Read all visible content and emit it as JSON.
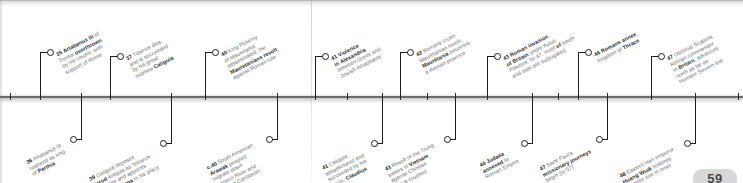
{
  "figure": {
    "kind": "historical-timeline",
    "orientation": "horizontal",
    "page_number": "59",
    "era_range": "35-48 AD"
  },
  "events_above": [
    {
      "id": "ev-35",
      "year": "35",
      "x": 40,
      "lines": [
        {
          "t": "35 ",
          "b": true
        },
        {
          "t": "Artabanus III",
          "b": true
        },
        {
          "t": " of",
          "b": false
        }
      ],
      "text_lines": [
        "35 Artabanus III of",
        "Persia overthrown",
        "by his cousin, with",
        "support of Rome"
      ],
      "bold_head": "35 Artabanus III",
      "bold_tail": "overthrown"
    },
    {
      "id": "ev-37",
      "year": "37",
      "x": 110,
      "text_lines": [
        "37 Tiberius dies",
        "and is succeeded",
        "by his great",
        "nephew Caligula"
      ],
      "bold_head": "37",
      "bold_tail": "Caligula"
    },
    {
      "id": "ev-40-ptolemy",
      "year": "40",
      "x": 205,
      "text_lines": [
        "40 King Ptolemy",
        "of Mauretania",
        "assassinated, the",
        "Mauretanians revolt",
        "against Roman rule"
      ],
      "bold_head": "40",
      "bold_tail": "Mauretanians revolt"
    },
    {
      "id": "ev-41-alexandria",
      "year": "41",
      "x": 315,
      "text_lines": [
        "41 Violence",
        "in Alexandria",
        "between Greek and",
        "Jewish inhabitants"
      ],
      "bold_head": "41 Violence in Alexandria",
      "bold_tail": ""
    },
    {
      "id": "ev-42",
      "year": "42",
      "x": 400,
      "text_lines": [
        "42 Romans crush",
        "Mauretanian revolt,",
        "Mauretania becomes",
        "a Roman province"
      ],
      "bold_head": "42",
      "bold_tail": "Mauretania"
    },
    {
      "id": "ev-43-britain",
      "year": "43",
      "x": 487,
      "text_lines": [
        "43 Roman invasion",
        "of Britain under Aulus",
        "Plautius; by 47, most of south",
        "and east are subjugated"
      ],
      "bold_head": "43 Roman invasion of Britain",
      "bold_tail": ""
    },
    {
      "id": "ev-46",
      "year": "46",
      "x": 578,
      "text_lines": [
        "46 Romans annex",
        "kingdom of Thrace"
      ],
      "bold_head": "46 Romans annex",
      "bold_tail": "Thrace"
    },
    {
      "id": "ev-47-ostorius",
      "year": "47",
      "x": 651,
      "text_lines": [
        "47 Ostorius Scapula,",
        "Roman commander",
        "in Britain, advances",
        "north as far as",
        "Humber-Severn line"
      ],
      "bold_head": "47",
      "bold_tail": "Britain"
    }
  ],
  "events_below": [
    {
      "id": "ev-36",
      "year": "36",
      "x": 81,
      "text_lines": [
        "36 Artabanus III",
        "restored as king",
        "of Parthia"
      ],
      "bold_head": "36",
      "bold_tail": "Parthia"
    },
    {
      "id": "ev-39",
      "year": "39",
      "x": 171,
      "text_lines": [
        "39 Caligula deposes",
        "Herod Antipas as Tetrarch",
        "of Galilee and appoints",
        "Herod Agrippa in his place"
      ],
      "bold_head": "39",
      "bold_tail": "Herod Agrippa"
    },
    {
      "id": "ev-c40-arawak",
      "year": "c.40",
      "x": 277,
      "text_lines": [
        "c.40 South American",
        "Arawak peoples",
        "migrate down",
        "Orinoco River and",
        "settle in Caribbean"
      ],
      "bold_head": "c.40",
      "bold_tail": "Arawak"
    },
    {
      "id": "ev-41-caligula",
      "year": "41",
      "x": 382,
      "text_lines": [
        "41 Caligula",
        "assassinated and",
        "succeeded by his",
        "uncle, Claudius"
      ],
      "bold_head": "41",
      "bold_tail": "Claudius"
    },
    {
      "id": "ev-43-trung",
      "year": "43",
      "x": 455,
      "text_lines": [
        "43 Revolt of the Trung",
        "sisters in Vietnam",
        "against Chinese",
        "rule is crushed"
      ],
      "bold_head": "43",
      "bold_tail": "Vietnam"
    },
    {
      "id": "ev-44-judaea",
      "year": "44",
      "x": 532,
      "text_lines": [
        "44 Judaea",
        "annexed to",
        "Roman Empire"
      ],
      "bold_head": "44 Judaea annexed",
      "bold_tail": ""
    },
    {
      "id": "ev-47-paul",
      "year": "47",
      "x": 607,
      "text_lines": [
        "47 Saint Paul's",
        "missionary journeys",
        "begin (to 57)"
      ],
      "bold_head": "47",
      "bold_tail": "missionary journeys"
    },
    {
      "id": "ev-48-han",
      "year": "48",
      "x": 695,
      "text_lines": [
        "48 Eastern Han emperor",
        "Huang Wudi restores",
        "Chinese rule in inner",
        "Mongolia"
      ],
      "bold_head": "48",
      "bold_tail": "Huang Wudi"
    }
  ],
  "rail_ticks": [
    10,
    40,
    81,
    110,
    171,
    205,
    277,
    315,
    347,
    382,
    400,
    427,
    455,
    487,
    532,
    558,
    578,
    607,
    651,
    695,
    738
  ]
}
